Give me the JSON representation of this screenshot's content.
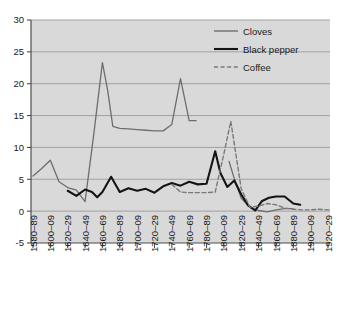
{
  "chart_data": {
    "type": "line",
    "title": "",
    "subtitle": "",
    "xlabel": "",
    "ylabel": "",
    "ylim": [
      -5,
      30
    ],
    "yticks": [
      "-5",
      "0",
      "5",
      "10",
      "15",
      "20",
      "25",
      "30"
    ],
    "ytick_values": [
      -5,
      0,
      5,
      10,
      15,
      20,
      25,
      30
    ],
    "grid": true,
    "legend_position": "top-right",
    "categories": [
      "1580–89",
      "1600–09",
      "1620–29",
      "1640–49",
      "1660–69",
      "1680–89",
      "1700–09",
      "1720–29",
      "1740–49",
      "1760–69",
      "1780–89",
      "1800–09",
      "1820–29",
      "1840–49",
      "1860–69",
      "1880–89",
      "1900–09",
      "1920–29"
    ],
    "x_index": [
      0,
      1,
      2,
      3,
      4,
      5,
      6,
      7,
      8,
      9,
      10,
      11,
      12,
      13,
      14,
      15,
      16,
      17
    ],
    "series": [
      {
        "name": "Cloves",
        "color": "#6e6e6e",
        "style": "solid",
        "width": 1.3,
        "segments": [
          {
            "x": [
              0,
              0.5,
              1,
              1.5,
              2,
              2.5,
              3,
              3.5,
              4,
              4.3,
              4.6,
              5,
              5.5,
              6,
              6.5,
              7,
              7.5,
              8,
              8.5,
              9,
              9.4
            ],
            "y": [
              5.5,
              6.7,
              8.0,
              4.6,
              3.7,
              3.3,
              1.5,
              12.0,
              23.3,
              19.0,
              13.3,
              13.0,
              12.9,
              12.8,
              12.7,
              12.6,
              12.6,
              13.6,
              20.8,
              14.2,
              14.2
            ]
          },
          {
            "x": [
              11.3,
              11.6,
              12,
              12.5,
              13,
              13.5,
              14,
              14.5,
              15
            ],
            "y": [
              7.8,
              5.1,
              2.0,
              0.6,
              0.1,
              -0.1,
              0.2,
              0.4,
              0.4
            ]
          }
        ]
      },
      {
        "name": "Black pepper",
        "color": "#141414",
        "style": "solid",
        "width": 2.1,
        "segments": [
          {
            "x": [
              2,
              2.5,
              3,
              3.4,
              3.7,
              4,
              4.5,
              5,
              5.5,
              6,
              6.5,
              7,
              7.5,
              8,
              8.5,
              9,
              9.5,
              10,
              10.5,
              10.8,
              11.2,
              11.6,
              12,
              12.4,
              12.8,
              13.2,
              13.6,
              14,
              14.5,
              15,
              15.4
            ],
            "y": [
              3.2,
              2.4,
              3.4,
              3.0,
              2.2,
              3.0,
              5.4,
              3.0,
              3.6,
              3.2,
              3.5,
              2.9,
              3.9,
              4.4,
              4.0,
              4.6,
              4.2,
              4.3,
              9.4,
              6.0,
              3.8,
              4.8,
              2.6,
              0.9,
              0.1,
              1.6,
              2.1,
              2.3,
              2.3,
              1.2,
              1.0
            ]
          }
        ]
      },
      {
        "name": "Coffee",
        "color": "#7a7a7a",
        "style": "dashed",
        "width": 1.4,
        "segments": [
          {
            "x": [
              8,
              8.5,
              9,
              9.5,
              10,
              10.5,
              11,
              11.4,
              12,
              12.5,
              13,
              13.5,
              14,
              14.5,
              15,
              15.5,
              16,
              16.5,
              17,
              17.4
            ],
            "y": [
              4.2,
              3.0,
              2.9,
              2.9,
              2.9,
              3.0,
              9.0,
              14.1,
              3.5,
              0.6,
              0.8,
              1.2,
              1.0,
              0.5,
              0.3,
              0.2,
              0.2,
              0.3,
              0.2,
              0.2
            ]
          }
        ]
      }
    ],
    "legend": [
      {
        "label": "Cloves",
        "color": "#6e6e6e",
        "style": "solid"
      },
      {
        "label": "Black pepper",
        "color": "#141414",
        "style": "solid"
      },
      {
        "label": "Coffee",
        "color": "#7a7a7a",
        "style": "dashed"
      }
    ]
  },
  "colors": {
    "plot_background": "#d9d9d9",
    "page_background": "#ffffff",
    "gridline": "#9b9b9b",
    "axis": "#4d4d4d",
    "text": "#1a1a1a"
  }
}
